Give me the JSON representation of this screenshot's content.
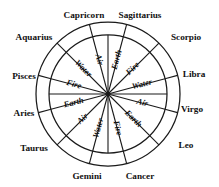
{
  "diagram": {
    "type": "zodiac-wheel",
    "geometry": {
      "center_x": 108,
      "center_y": 94,
      "outer_radius": 72,
      "inner_radius": 59,
      "sector_count": 12,
      "sector_span_degrees": 30,
      "sector_offset_degrees": 15
    },
    "colors": {
      "background": "#ffffff",
      "stroke": "#1a1a1a",
      "text": "#111111"
    },
    "signs": [
      {
        "label": "Capricorn",
        "angle": 285,
        "label_x": 84,
        "label_y": 16,
        "anchor": "middle"
      },
      {
        "label": "Sagittarius",
        "angle": 315,
        "label_x": 140,
        "label_y": 16,
        "anchor": "middle"
      },
      {
        "label": "Scorpio",
        "angle": 345,
        "label_x": 186,
        "label_y": 38,
        "anchor": "middle"
      },
      {
        "label": "Libra",
        "angle": 15,
        "label_x": 194,
        "label_y": 75,
        "anchor": "middle"
      },
      {
        "label": "Virgo",
        "angle": 45,
        "label_x": 192,
        "label_y": 110,
        "anchor": "middle"
      },
      {
        "label": "Leo",
        "angle": 75,
        "label_x": 186,
        "label_y": 146,
        "anchor": "middle"
      },
      {
        "label": "Cancer",
        "angle": 105,
        "label_x": 140,
        "label_y": 177,
        "anchor": "middle"
      },
      {
        "label": "Gemini",
        "angle": 135,
        "label_x": 87,
        "label_y": 177,
        "anchor": "middle"
      },
      {
        "label": "Taurus",
        "angle": 165,
        "label_x": 34,
        "label_y": 149,
        "anchor": "middle"
      },
      {
        "label": "Aries",
        "angle": 195,
        "label_x": 24,
        "label_y": 114,
        "anchor": "middle"
      },
      {
        "label": "Pisces",
        "angle": 225,
        "label_x": 24,
        "label_y": 77,
        "anchor": "middle"
      },
      {
        "label": "Aquarius",
        "angle": 255,
        "label_x": 34,
        "label_y": 38,
        "anchor": "middle"
      }
    ],
    "elements": [
      {
        "label": "Earth",
        "sector_index": 0,
        "mid_angle": 285,
        "text_angle": -75
      },
      {
        "label": "Fire",
        "sector_index": 1,
        "mid_angle": 315,
        "text_angle": -45
      },
      {
        "label": "Water",
        "sector_index": 2,
        "mid_angle": 345,
        "text_angle": -15
      },
      {
        "label": "Air",
        "sector_index": 3,
        "mid_angle": 15,
        "text_angle": 15
      },
      {
        "label": "Earth",
        "sector_index": 4,
        "mid_angle": 45,
        "text_angle": 45
      },
      {
        "label": "Fire",
        "sector_index": 5,
        "mid_angle": 75,
        "text_angle": 75
      },
      {
        "label": "Water",
        "sector_index": 6,
        "mid_angle": 105,
        "text_angle": -75
      },
      {
        "label": "Air",
        "sector_index": 7,
        "mid_angle": 135,
        "text_angle": -45
      },
      {
        "label": "Earth",
        "sector_index": 8,
        "mid_angle": 165,
        "text_angle": -15
      },
      {
        "label": "Fire",
        "sector_index": 9,
        "mid_angle": 195,
        "text_angle": 15
      },
      {
        "label": "Water",
        "sector_index": 10,
        "mid_angle": 225,
        "text_angle": 45
      },
      {
        "label": "Air",
        "sector_index": 11,
        "mid_angle": 255,
        "text_angle": 75
      }
    ],
    "element_order": [
      "Fire",
      "Earth",
      "Air",
      "Water"
    ]
  }
}
